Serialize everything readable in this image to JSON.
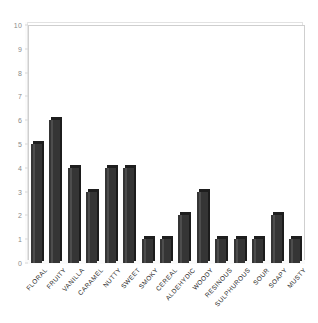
{
  "chart_data": {
    "type": "bar",
    "title": "",
    "subtitle": "",
    "xlabel": "",
    "ylabel": "",
    "ylim": [
      0,
      10
    ],
    "ytick_step": 1,
    "yticks": [
      0,
      1,
      2,
      3,
      4,
      5,
      6,
      7,
      8,
      9,
      10
    ],
    "grid": false,
    "legend": null,
    "categories": [
      "FLORAL",
      "FRUITY",
      "VANILLA",
      "CARAMEL",
      "NUTTY",
      "SWEET",
      "SMOKY",
      "CEREAL",
      "ALDEHYDIC",
      "WOODY",
      "RESINOUS",
      "SULPHUROUS",
      "SOUR",
      "SOAPY",
      "MUSTY"
    ],
    "values": [
      5,
      6,
      4,
      3,
      4,
      4,
      1,
      1,
      2,
      3,
      1,
      1,
      1,
      2,
      1
    ],
    "bar_color": "#353535",
    "bar_top_color": "#1e1e1e",
    "bar_side_color": "#1c1c1c",
    "axis_color": "#cfcfcf",
    "tick_label_color": "#8a8a8a",
    "category_label_color": "#2a2a2a",
    "background_color": "#ffffff"
  }
}
